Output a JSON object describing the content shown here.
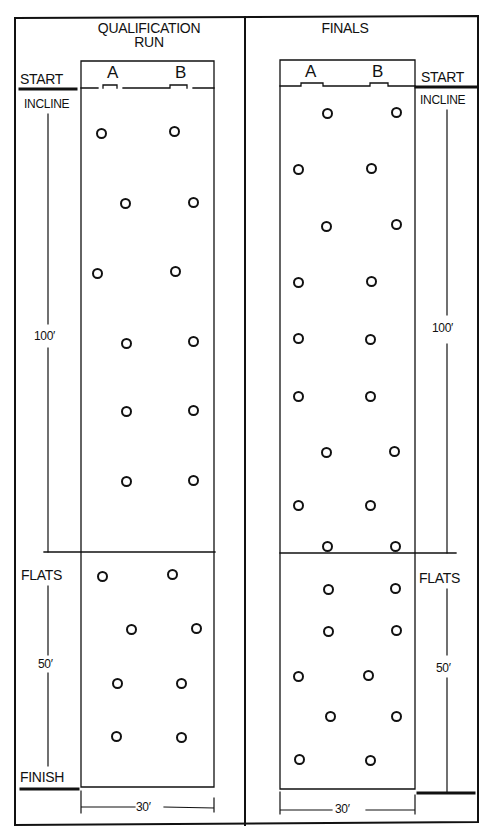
{
  "qualification": {
    "title_line1": "QUALIFICATION",
    "title_line2": "RUN",
    "lane_a": "A",
    "lane_b": "B",
    "start_label": "START",
    "incline_label": "INCLINE",
    "incline_length": "100′",
    "flats_label": "FLATS",
    "flats_length": "50′",
    "finish_label": "FINISH",
    "width_label": "30′",
    "gates_incline": [
      [
        101,
        133
      ],
      [
        174,
        131
      ],
      [
        125,
        203
      ],
      [
        193,
        202
      ],
      [
        97,
        273
      ],
      [
        175,
        271
      ],
      [
        126,
        343
      ],
      [
        193,
        341
      ],
      [
        126,
        411
      ],
      [
        193,
        410
      ],
      [
        126,
        481
      ],
      [
        193,
        480
      ]
    ],
    "gates_flats": [
      [
        102,
        576
      ],
      [
        172,
        574
      ],
      [
        131,
        629
      ],
      [
        196,
        628
      ],
      [
        117,
        683
      ],
      [
        181,
        683
      ],
      [
        116,
        736
      ],
      [
        181,
        737
      ]
    ]
  },
  "finals": {
    "title": "FINALS",
    "lane_a": "A",
    "lane_b": "B",
    "start_label": "START",
    "incline_label": "INCLINE",
    "incline_length": "100′",
    "flats_label": "FLATS",
    "flats_length": "50′",
    "width_label": "30′",
    "gates": [
      [
        327,
        113
      ],
      [
        396,
        112
      ],
      [
        298,
        169
      ],
      [
        371,
        168
      ],
      [
        326,
        226
      ],
      [
        396,
        224
      ],
      [
        298,
        282
      ],
      [
        371,
        281
      ],
      [
        298,
        338
      ],
      [
        370,
        339
      ],
      [
        298,
        396
      ],
      [
        370,
        396
      ],
      [
        326,
        452
      ],
      [
        394,
        451
      ],
      [
        298,
        505
      ],
      [
        370,
        505
      ],
      [
        327,
        546
      ],
      [
        395,
        546
      ],
      [
        328,
        589
      ],
      [
        395,
        588
      ],
      [
        328,
        631
      ],
      [
        396,
        630
      ],
      [
        298,
        676
      ],
      [
        368,
        675
      ],
      [
        330,
        716
      ],
      [
        396,
        716
      ],
      [
        299,
        759
      ],
      [
        370,
        760
      ]
    ]
  },
  "colors": {
    "ink": "#111111",
    "paper": "#ffffff"
  }
}
